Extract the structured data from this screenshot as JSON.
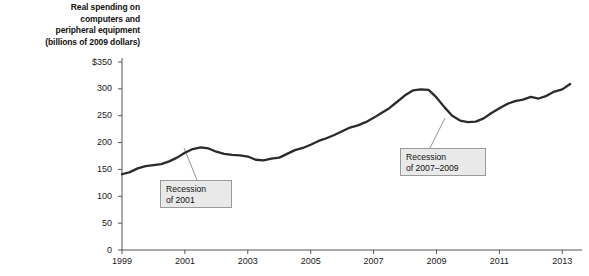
{
  "chart_data": {
    "type": "line",
    "title": "Real spending on computers and peripheral equipment (billions of 2009 dollars)",
    "title_lines": [
      "Real spending on",
      "computers and",
      "peripheral equipment",
      "(billions of 2009 dollars)"
    ],
    "xlabel": "",
    "ylabel": "billions of 2009 dollars",
    "xlim": [
      1999,
      2013.5
    ],
    "ylim": [
      0,
      350
    ],
    "grid": false,
    "legend": null,
    "yticks": [
      0,
      50,
      100,
      150,
      200,
      250,
      300,
      350
    ],
    "ytick_labels": [
      "0",
      "50",
      "100",
      "150",
      "200",
      "250",
      "300",
      "$350"
    ],
    "xticks": [
      1999,
      2001,
      2003,
      2005,
      2007,
      2009,
      2011,
      2013
    ],
    "xtick_labels": [
      "1999",
      "2001",
      "2003",
      "2005",
      "2007",
      "2009",
      "2011",
      "2013"
    ],
    "line_color": "#2b2b2b",
    "series": [
      {
        "name": "Real spending on computers and peripheral equipment",
        "x": [
          1999.0,
          1999.25,
          1999.5,
          1999.75,
          2000.0,
          2000.25,
          2000.5,
          2000.75,
          2001.0,
          2001.25,
          2001.5,
          2001.75,
          2002.0,
          2002.25,
          2002.5,
          2002.75,
          2003.0,
          2003.25,
          2003.5,
          2003.75,
          2004.0,
          2004.25,
          2004.5,
          2004.75,
          2005.0,
          2005.25,
          2005.5,
          2005.75,
          2006.0,
          2006.25,
          2006.5,
          2006.75,
          2007.0,
          2007.25,
          2007.5,
          2007.75,
          2008.0,
          2008.25,
          2008.5,
          2008.75,
          2009.0,
          2009.25,
          2009.5,
          2009.75,
          2010.0,
          2010.25,
          2010.5,
          2010.75,
          2011.0,
          2011.25,
          2011.5,
          2011.75,
          2012.0,
          2012.25,
          2012.5,
          2012.75,
          2013.0,
          2013.25
        ],
        "values": [
          141,
          145,
          152,
          156,
          158,
          160,
          165,
          172,
          181,
          188,
          191,
          189,
          183,
          179,
          177,
          176,
          174,
          168,
          167,
          170,
          172,
          179,
          186,
          190,
          196,
          203,
          208,
          214,
          221,
          228,
          232,
          238,
          246,
          255,
          264,
          276,
          288,
          297,
          299,
          298,
          284,
          266,
          250,
          241,
          238,
          239,
          245,
          255,
          264,
          272,
          277,
          280,
          285,
          282,
          287,
          295,
          299,
          309
        ]
      }
    ],
    "annotations": [
      {
        "name": "recession-2001",
        "lines": [
          "Recession",
          "of 2001"
        ],
        "box_x": 160,
        "box_y": 180,
        "box_w": 72,
        "box_h": 28,
        "leader_from_x": 197,
        "leader_from_y": 180,
        "leader_to_x": 184,
        "leader_to_y": 148
      },
      {
        "name": "recession-2007-2009",
        "lines": [
          "Recession",
          "of 2007–2009"
        ],
        "box_x": 400,
        "box_y": 148,
        "box_w": 86,
        "box_h": 28,
        "leader_from_x": 430,
        "leader_from_y": 148,
        "leader_to_x": 445,
        "leader_to_y": 118
      }
    ]
  }
}
